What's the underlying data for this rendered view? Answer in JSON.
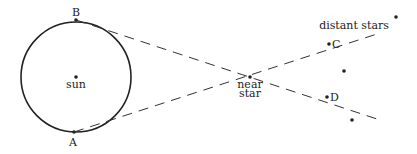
{
  "diagram": {
    "labels": {
      "B": "B",
      "A": "A",
      "sun": "sun",
      "near_star_1": "near",
      "near_star_2": "star",
      "distant_stars": "distant stars",
      "C": "C",
      "D": "D"
    },
    "colors": {
      "stroke": "#222222",
      "background": "#ffffff"
    }
  }
}
